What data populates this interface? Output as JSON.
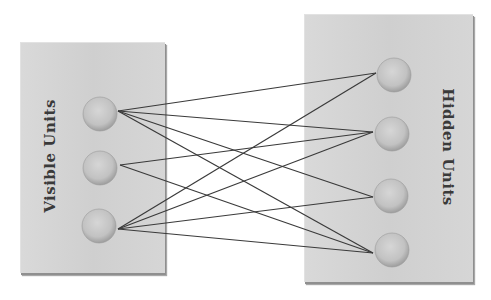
{
  "diagram": {
    "type": "bipartite-network",
    "layers": [
      {
        "id": "visible",
        "label": "Visible Units",
        "box": {
          "x": 20,
          "y": 42,
          "w": 144,
          "h": 230
        },
        "label_rotation": -90,
        "units": [
          {
            "id": "v1",
            "cx": 100,
            "cy": 114
          },
          {
            "id": "v2",
            "cx": 100,
            "cy": 168
          },
          {
            "id": "v3",
            "cx": 99,
            "cy": 226
          }
        ]
      },
      {
        "id": "hidden",
        "label": "Hidden Units",
        "box": {
          "x": 304,
          "y": 14,
          "w": 168,
          "h": 267
        },
        "label_rotation": 90,
        "units": [
          {
            "id": "h1",
            "cx": 394,
            "cy": 75
          },
          {
            "id": "h2",
            "cx": 392,
            "cy": 134
          },
          {
            "id": "h3",
            "cx": 391,
            "cy": 196
          },
          {
            "id": "h4",
            "cx": 392,
            "cy": 250
          }
        ]
      }
    ],
    "edges": [
      {
        "from": "v1",
        "to": "h1"
      },
      {
        "from": "v1",
        "to": "h2"
      },
      {
        "from": "v1",
        "to": "h3"
      },
      {
        "from": "v1",
        "to": "h4"
      },
      {
        "from": "v2",
        "to": "h2"
      },
      {
        "from": "v2",
        "to": "h4"
      },
      {
        "from": "v3",
        "to": "h1"
      },
      {
        "from": "v3",
        "to": "h2"
      },
      {
        "from": "v3",
        "to": "h3"
      },
      {
        "from": "v3",
        "to": "h4"
      }
    ],
    "anchors": {
      "v1": [
        118,
        111
      ],
      "v2": [
        120,
        165
      ],
      "v3": [
        118,
        229
      ],
      "h1": [
        376,
        73
      ],
      "h2": [
        373,
        132
      ],
      "h3": [
        373,
        197
      ],
      "h4": [
        373,
        253
      ]
    },
    "colors": {
      "box_fill": "#d2d2d2",
      "box_shadow": "#8f8f8f",
      "unit_fill": "#c4c4c4",
      "unit_edge": "#9a9a9a",
      "edge_stroke": "#3a3a3a",
      "label": "#3a3a3a"
    }
  }
}
